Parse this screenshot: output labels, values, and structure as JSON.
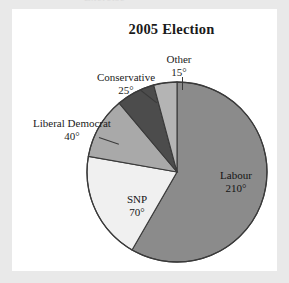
{
  "figure": {
    "title": "2005 Election",
    "ghost_text": "Exercise",
    "background_color": "#e9e9e9",
    "card_color": "#ffffff"
  },
  "chart_data": {
    "type": "pie",
    "title": "2005 Election",
    "unit": "degrees",
    "total_degrees": 360,
    "start_angle_deg": 0,
    "direction": "clockwise",
    "grid": false,
    "legend": "none",
    "labels_inside": [
      "Labour",
      "SNP"
    ],
    "labels_outside": [
      "Other",
      "Conservative",
      "Liberal Democrat"
    ],
    "categories": [
      "Labour",
      "SNP",
      "Liberal Democrat",
      "Conservative",
      "Other"
    ],
    "values": [
      210,
      70,
      40,
      25,
      15
    ],
    "slices": [
      {
        "name": "Labour",
        "value_label": "210°",
        "degrees": 210,
        "color": "#8b8b8b",
        "label_placement": "inside",
        "leader_line": false
      },
      {
        "name": "SNP",
        "value_label": "70°",
        "degrees": 70,
        "color": "#f0f0f0",
        "label_placement": "inside",
        "leader_line": false
      },
      {
        "name": "Liberal Democrat",
        "value_label": "40°",
        "degrees": 40,
        "color": "#a9a9a9",
        "label_placement": "outside",
        "leader_line": true
      },
      {
        "name": "Conservative",
        "value_label": "25°",
        "degrees": 25,
        "color": "#4c4c4c",
        "label_placement": "outside",
        "leader_line": true
      },
      {
        "name": "Other",
        "value_label": "15°",
        "degrees": 15,
        "color": "#b4b4b4",
        "label_placement": "outside",
        "leader_line": true
      }
    ],
    "outline_color": "#3a3a3a",
    "xlabel": "",
    "ylabel": ""
  }
}
